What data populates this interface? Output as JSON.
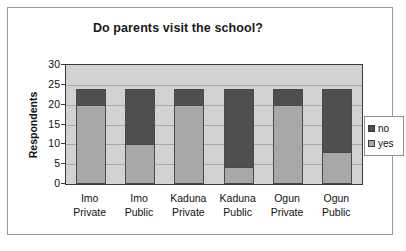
{
  "chart_data": {
    "type": "bar",
    "subtype": "stacked-column",
    "title": "Do parents visit the school?",
    "xlabel": "",
    "ylabel": "Respondents",
    "ylim": [
      0,
      30
    ],
    "ytick_step": 5,
    "yticks": [
      "0",
      "5",
      "10",
      "15",
      "20",
      "25",
      "30"
    ],
    "grid": true,
    "legend_position": "right",
    "categories": [
      "Imo Private",
      "Imo Public",
      "Kaduna Private",
      "Kaduna Public",
      "Ogun Private",
      "Ogun Public"
    ],
    "category_lines": [
      [
        "Imo",
        "Private"
      ],
      [
        "Imo",
        "Public"
      ],
      [
        "Kaduna",
        "Private"
      ],
      [
        "Kaduna",
        "Public"
      ],
      [
        "Ogun",
        "Private"
      ],
      [
        "Ogun",
        "Public"
      ]
    ],
    "series": [
      {
        "name": "yes",
        "color": "#a8a8a8",
        "values": [
          20,
          10,
          20,
          4,
          20,
          8
        ]
      },
      {
        "name": "no",
        "color": "#4f4f4f",
        "values": [
          4,
          14,
          4,
          20,
          4,
          16
        ]
      }
    ],
    "totals": [
      24,
      24,
      24,
      24,
      24,
      24
    ],
    "plot_background": "#d2d2d2",
    "gridline_color": "#a9a9a9",
    "axis_color": "#3a3a3a"
  },
  "legend": {
    "items": [
      {
        "label": "no",
        "color": "#4f4f4f"
      },
      {
        "label": "yes",
        "color": "#a8a8a8"
      }
    ]
  }
}
